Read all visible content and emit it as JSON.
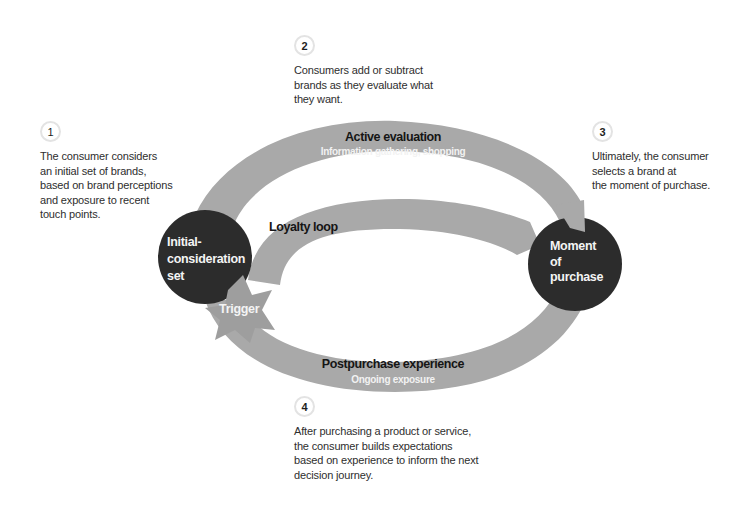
{
  "diagram": {
    "colors": {
      "band": "#a9a9a9",
      "node": "#2c2c2c",
      "node_text": "#f4f4f4",
      "stage_title": "#151515",
      "stage_subtitle": "#f2f2f2",
      "body_text": "#2e2e2e",
      "badge_border": "#e3e3e3"
    },
    "nodes": {
      "initial": {
        "line1": "Initial-",
        "line2": "consideration",
        "line3": "set"
      },
      "purchase": {
        "line1": "Moment",
        "line2": "of",
        "line3": "purchase"
      }
    },
    "stages": {
      "active_evaluation": {
        "title": "Active evaluation",
        "subtitle": "Information gathering, shopping"
      },
      "loyalty_loop": {
        "title": "Loyalty loop"
      },
      "postpurchase": {
        "title": "Postpurchase experience",
        "subtitle": "Ongoing exposure"
      },
      "trigger": {
        "title": "Trigger"
      }
    },
    "steps": [
      {
        "number": "1",
        "text": "The consumer considers\nan initial set of brands,\nbased on brand perceptions\nand exposure to recent\ntouch points."
      },
      {
        "number": "2",
        "text": "Consumers add or subtract\nbrands as they evaluate what\nthey want."
      },
      {
        "number": "3",
        "text": "Ultimately, the consumer\nselects a brand at\nthe moment of purchase."
      },
      {
        "number": "4",
        "text": "After purchasing a product or service,\nthe consumer builds expectations\nbased on experience to inform the next\ndecision journey."
      }
    ]
  }
}
